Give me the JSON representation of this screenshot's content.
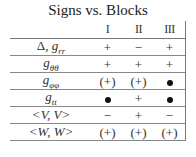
{
  "title": "Signs vs. Blocks",
  "table": {
    "columns": [
      "",
      "I",
      "II",
      "III"
    ],
    "rows": [
      {
        "label": "Δ, g_rr",
        "display": "Δ, grr",
        "values": [
          "+",
          "−",
          "+"
        ]
      },
      {
        "label": "g_θθ",
        "display": "gθθ",
        "values": [
          "+",
          "+",
          "+"
        ]
      },
      {
        "label": "g_φφ",
        "display": "gφφ",
        "values": [
          "(+)",
          "(+)",
          "•"
        ]
      },
      {
        "label": "g_tt",
        "display": "gtt",
        "values": [
          "•",
          "+",
          "•"
        ]
      },
      {
        "label": "<V, V>",
        "display": "<V, V>",
        "values": [
          "−",
          "+",
          "−"
        ]
      },
      {
        "label": "<W, W>",
        "display": "<W, W>",
        "values": [
          "(+)",
          "(+)",
          "(+)"
        ]
      }
    ]
  }
}
